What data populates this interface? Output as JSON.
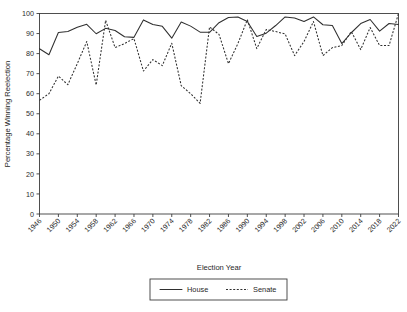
{
  "chart_data": {
    "type": "line",
    "title": "",
    "xlabel": "Election Year",
    "ylabel": "Percentage Winning Reelection",
    "xlim": [
      1946,
      2022
    ],
    "ylim": [
      0,
      100
    ],
    "grid": false,
    "legend_position": "bottom-center",
    "x": [
      1946,
      1948,
      1950,
      1952,
      1954,
      1956,
      1958,
      1960,
      1962,
      1964,
      1966,
      1968,
      1970,
      1972,
      1974,
      1976,
      1978,
      1980,
      1982,
      1984,
      1986,
      1988,
      1990,
      1992,
      1994,
      1996,
      1998,
      2000,
      2002,
      2004,
      2006,
      2008,
      2010,
      2012,
      2014,
      2016,
      2018,
      2020,
      2022
    ],
    "xticks": [
      "1946",
      "1950",
      "1954",
      "1958",
      "1962",
      "1966",
      "1970",
      "1974",
      "1978",
      "1982",
      "1986",
      "1990",
      "1994",
      "1998",
      "2002",
      "2006",
      "2010",
      "2014",
      "2018",
      "2022"
    ],
    "yticks": [
      "0",
      "10",
      "20",
      "30",
      "40",
      "50",
      "60",
      "70",
      "80",
      "90",
      "100"
    ],
    "series": [
      {
        "name": "House",
        "style": "solid",
        "color": "#2f2f2f",
        "values": [
          82.4,
          79.4,
          90.5,
          91.0,
          93.1,
          94.6,
          89.9,
          92.6,
          91.5,
          88.4,
          88.1,
          96.8,
          94.5,
          93.6,
          87.7,
          95.8,
          93.7,
          90.7,
          90.6,
          95.4,
          98.0,
          98.3,
          96.0,
          88.5,
          90.2,
          94.0,
          98.3,
          97.8,
          96.0,
          98.3,
          94.4,
          94.0,
          85.0,
          90.4,
          95.0,
          97.0,
          91.2,
          95.0,
          94.5
        ]
      },
      {
        "name": "Senate",
        "style": "dashed",
        "color": "#2f2f2f",
        "values": [
          56.7,
          60.0,
          68.8,
          64.5,
          75.0,
          86.0,
          64.3,
          96.6,
          83.0,
          85.0,
          87.5,
          71.3,
          77.0,
          74.0,
          85.2,
          64.0,
          60.0,
          55.2,
          93.3,
          89.6,
          75.0,
          85.0,
          96.9,
          82.5,
          92.0,
          91.0,
          89.8,
          79.0,
          86.0,
          96.0,
          79.0,
          83.0,
          84.0,
          91.0,
          82.0,
          93.0,
          84.0,
          84.0,
          100.0
        ]
      }
    ]
  },
  "legend": {
    "items": [
      {
        "label": "House",
        "style": "solid"
      },
      {
        "label": "Senate",
        "style": "dashed"
      }
    ]
  }
}
